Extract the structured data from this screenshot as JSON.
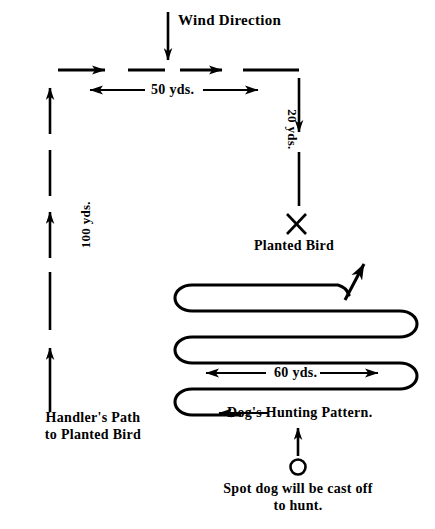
{
  "diagram": {
    "background_color": "#ffffff",
    "ink_color": "#000000",
    "labels": {
      "wind_direction": "Wind Direction",
      "fifty_yards": "50 yds.",
      "twenty_yards": "20 yds.",
      "hundred_yards": "100 yds.",
      "sixty_yards": "60 yds.",
      "planted_bird": "Planted Bird",
      "handlers_path_line1": "Handler's Path",
      "handlers_path_line2": "to Planted Bird",
      "dogs_hunting_pattern": "Dog's Hunting Pattern.",
      "cast_off_line1": "Spot dog will be cast off",
      "cast_off_line2": "to hunt."
    },
    "measurements": [
      {
        "name": "top-leg",
        "value": "50 yds.",
        "orientation": "horizontal"
      },
      {
        "name": "right-leg",
        "value": "20 yds.",
        "orientation": "vertical"
      },
      {
        "name": "left-leg",
        "value": "100 yds.",
        "orientation": "vertical"
      },
      {
        "name": "sweep-width",
        "value": "60 yds.",
        "orientation": "horizontal"
      }
    ],
    "markers": {
      "planted_bird_marker": "X",
      "cast_off_marker": "circle"
    }
  }
}
